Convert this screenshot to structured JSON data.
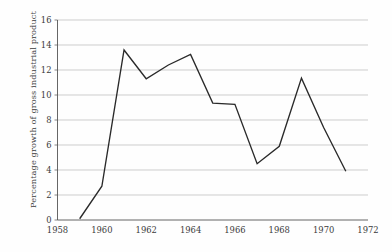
{
  "chart_data": {
    "type": "line",
    "title": "",
    "xlabel": "",
    "ylabel": "Percentage growth of gross industrial product",
    "x": [
      1959,
      1960,
      1961,
      1962,
      1963,
      1964,
      1965,
      1966,
      1967,
      1968,
      1969,
      1970,
      1971
    ],
    "values": [
      0.1,
      2.7,
      13.6,
      11.3,
      12.4,
      13.25,
      9.35,
      9.25,
      4.5,
      5.9,
      11.35,
      7.4,
      3.9
    ],
    "series": [
      {
        "name": "Percentage growth of gross industrial product",
        "values": [
          0.1,
          2.7,
          13.6,
          11.3,
          12.4,
          13.25,
          9.35,
          9.25,
          4.5,
          5.9,
          11.35,
          7.4,
          3.9
        ]
      }
    ],
    "xlim": [
      1958,
      1972
    ],
    "ylim": [
      0,
      16
    ],
    "xticks": [
      1958,
      1960,
      1962,
      1964,
      1966,
      1968,
      1970,
      1972
    ],
    "xtick_labels": [
      "1958",
      "1960",
      "1962",
      "1964",
      "1966",
      "1968",
      "1970",
      "1972"
    ],
    "yticks": [
      0,
      2,
      4,
      6,
      8,
      10,
      12,
      14,
      16
    ],
    "ytick_labels": [
      "0",
      "2",
      "4",
      "6",
      "8",
      "10",
      "12",
      "14",
      "16"
    ],
    "grid": "horizontal",
    "legend": "none",
    "line_color": "#2a2a2a",
    "grid_color": "#b9b9b9",
    "axis_color": "#555555",
    "background_color": "#ffffff"
  }
}
